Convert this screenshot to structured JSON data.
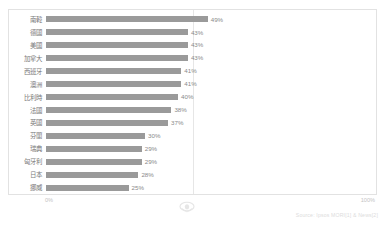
{
  "chart_data": {
    "type": "bar",
    "orientation": "horizontal",
    "title": "",
    "subtitle": "",
    "xlabel": "",
    "ylabel": "",
    "xlim": [
      0,
      100
    ],
    "grid": "vertical-midline-only",
    "legend": "none",
    "value_suffix": "%",
    "categories": [
      "南韓",
      "德國",
      "美國",
      "加拿大",
      "西班牙",
      "澳洲",
      "比利時",
      "法國",
      "英國",
      "芬蘭",
      "瑞典",
      "匈牙利",
      "日本",
      "挪威"
    ],
    "values": [
      49,
      43,
      43,
      43,
      41,
      41,
      40,
      38,
      37,
      30,
      29,
      29,
      28,
      25
    ],
    "value_labels": [
      "49%",
      "43%",
      "43%",
      "43%",
      "41%",
      "41%",
      "40%",
      "38%",
      "37%",
      "30%",
      "29%",
      "29%",
      "28%",
      "25%"
    ],
    "axis_ticks": [
      "0%",
      "100%"
    ],
    "colors": {
      "bar": "#9a9a9a",
      "frame": "#e2e2e2",
      "gridline": "#e6e6e6",
      "label_text": "#7a7a7a",
      "value_text": "#8a8a8a",
      "axis_text": "#c3c3c3",
      "source_text": "#dcdcdc",
      "background": "#ffffff"
    }
  },
  "axis": {
    "min_label": "0%",
    "max_label": "100%"
  },
  "footer": {
    "source_text": "Source: Ipsos MORI[1] & News[2]"
  },
  "watermark": {
    "icon": "crest-watermark-icon"
  }
}
